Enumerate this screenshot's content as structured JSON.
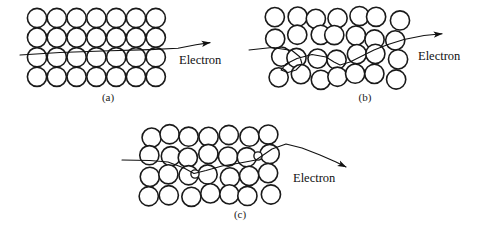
{
  "figure": {
    "type": "physics-diagram",
    "background_color": "#ffffff",
    "line_color": "#111111",
    "atom_stroke_color": "#1a1a1a",
    "width": 478,
    "height": 234
  },
  "panels": [
    {
      "id": "a",
      "caption": "(a)",
      "caption_x": 108,
      "caption_y": 101,
      "label": "Electron",
      "label_x": 179,
      "label_y": 64,
      "lattice": {
        "rows": 4,
        "cols": 7,
        "radius": 9.6,
        "x0": 37,
        "y0": 18,
        "dx": 19.8,
        "dy": 19.6,
        "jitter": 0,
        "row_offsets": [
          0,
          0,
          0,
          0
        ]
      },
      "path": "M 20,55 L 60,52.5 L 110,50.8 L 150,49.6 L 178,48.2 L 196,44.8 L 210,42.6",
      "arrow": {
        "x": 212,
        "y": 42,
        "angle": -14
      },
      "impurities": []
    },
    {
      "id": "b",
      "caption": "(b)",
      "caption_x": 365,
      "caption_y": 101,
      "label": "Electron",
      "label_x": 418,
      "label_y": 60,
      "lattice": {
        "rows": 4,
        "cols": 7,
        "radius": 9.6,
        "x0": 278,
        "y0": 18,
        "dx": 19.8,
        "dy": 19.6,
        "jitter": 3.4,
        "row_offsets": [
          0,
          0,
          0,
          0
        ]
      },
      "path": "M 249,50 L 272,47.5 L 292,50.5 L 300,57 L 302,64 L 296,70 L 288,72.5 L 281,70 L 286,64 L 297,58.5 L 312,54.5 L 326,57 L 334,62 L 340,65 L 350,62 L 362,56 L 374,50 L 388,44.5 L 404,39.5 L 424,35.5 L 442,33.8",
      "arrow": {
        "x": 444,
        "y": 33.6,
        "angle": -6
      },
      "impurities": []
    },
    {
      "id": "c",
      "caption": "(c)",
      "caption_x": 240,
      "caption_y": 218,
      "label": "Electron",
      "label_x": 293,
      "label_y": 182,
      "lattice": {
        "rows": 4,
        "cols": 7,
        "radius": 9.6,
        "x0": 150,
        "y0": 136,
        "dx": 19.8,
        "dy": 19.6,
        "jitter": 2.2,
        "row_offsets": [
          0,
          0,
          0,
          0
        ]
      },
      "path": "M 122,160 L 150,160.5 L 168,162 L 184,168 L 194,173.5 L 206,170.5 L 222,166 L 240,163 L 256,160 L 264,154.5 L 272,149 L 286,144 L 302,148 L 320,155 L 336,162 L 346,167",
      "arrow": {
        "x": 348,
        "y": 168,
        "angle": 27
      },
      "impurities": [
        {
          "x": 195,
          "y": 174,
          "r": 4.1
        },
        {
          "x": 258,
          "y": 156,
          "r": 4.1
        }
      ]
    }
  ]
}
